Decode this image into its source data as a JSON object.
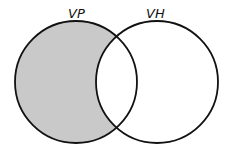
{
  "diagram": {
    "type": "venn",
    "sets": [
      {
        "id": "left",
        "label": "VP",
        "shaded": true
      },
      {
        "id": "right",
        "label": "VH",
        "shaded": false
      }
    ],
    "shaded_region": "VP only (VP minus VH)",
    "colors": {
      "shade": "#c9c9c9",
      "stroke": "#111111",
      "background": "#ffffff"
    }
  }
}
